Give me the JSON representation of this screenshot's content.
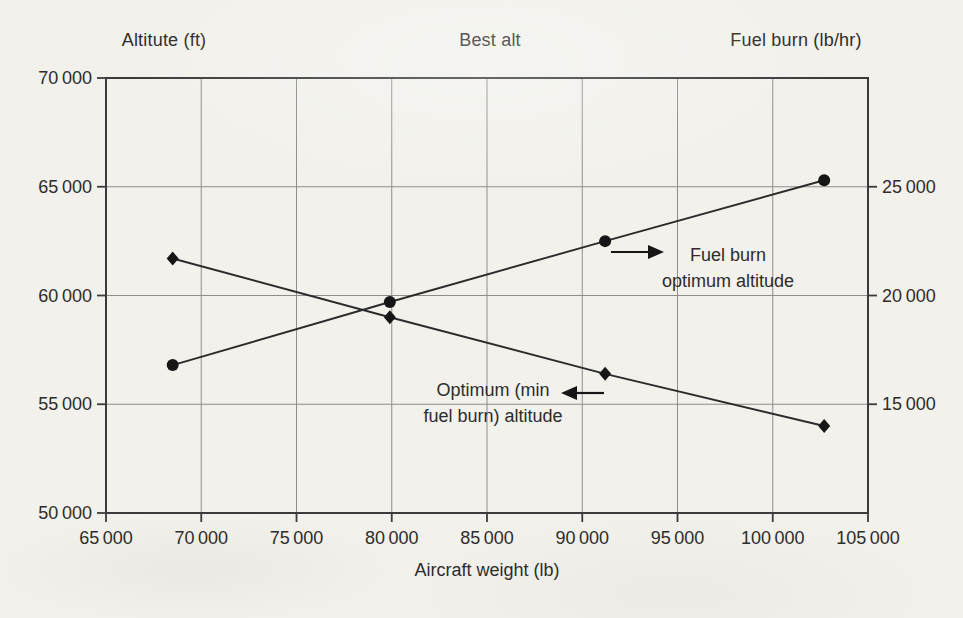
{
  "chart_data": {
    "type": "line",
    "title": "Best alt",
    "xlabel": "Aircraft weight (lb)",
    "ylabel_left": "Altitute (ft)",
    "ylabel_right": "Fuel burn (lb/hr)",
    "x": [
      68500,
      79900,
      91200,
      102700
    ],
    "series": [
      {
        "name": "Optimum (min fuel burn) altitude",
        "axis": "left",
        "marker": "diamond",
        "values": [
          61700,
          59000,
          56400,
          54000
        ]
      },
      {
        "name": "Fuel burn optimum altitude",
        "axis": "right",
        "marker": "circle",
        "values": [
          16800,
          19700,
          22500,
          25300
        ]
      }
    ],
    "xlim": [
      65000,
      105000
    ],
    "ylim_left": [
      50000,
      70000
    ],
    "ylim_right": [
      10000,
      30000
    ],
    "xticks": [
      65000,
      70000,
      75000,
      80000,
      85000,
      90000,
      95000,
      100000,
      105000
    ],
    "yticks_left": [
      50000,
      55000,
      60000,
      65000,
      70000
    ],
    "yticks_right": [
      15000,
      20000,
      25000
    ],
    "grid": true,
    "legend_position": "none",
    "thousands_separator": "thin-space"
  },
  "annotations": [
    {
      "lines": [
        "Fuel burn",
        "optimum altitude"
      ],
      "arrow": "right"
    },
    {
      "lines": [
        "Optimum (min",
        "fuel burn) altitude"
      ],
      "arrow": "left"
    }
  ],
  "colors": {
    "background": "#f2f1ec",
    "axis": "#3b3b3b",
    "grid": "#8f8d8a",
    "line": "#2b2b2b",
    "marker": "#161616",
    "text": "#2e2c2a"
  }
}
